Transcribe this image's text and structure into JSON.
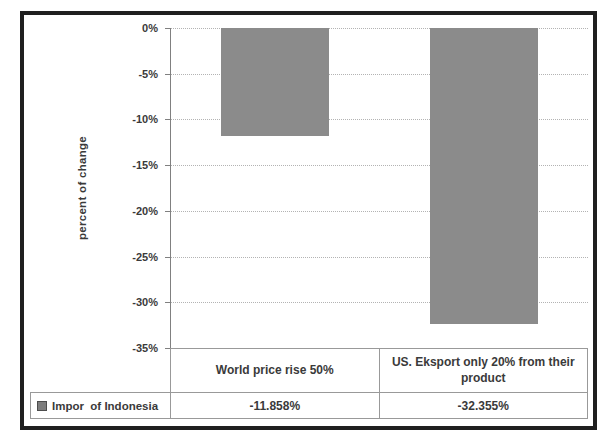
{
  "chart_data": {
    "type": "bar",
    "title": "",
    "xlabel": "",
    "ylabel": "percent of change",
    "categories": [
      "World price rise 50%",
      "US. Eksport only 20% from their product"
    ],
    "series": [
      {
        "name": "Impor  of Indonesia",
        "values": [
          -11.858,
          -32.355
        ]
      }
    ],
    "value_labels": [
      "-11.858%",
      "-32.355%"
    ],
    "y_ticks": [
      "0%",
      "-5%",
      "-10%",
      "-15%",
      "-20%",
      "-25%",
      "-30%",
      "-35%"
    ],
    "ylim": [
      -35,
      0
    ],
    "y_tick_step": 5,
    "grid": true,
    "legend_position": "bottom-left-data-table",
    "colors": {
      "bar": "#8b8b8b",
      "text": "#3a3a3a",
      "gridline": "#b3b3b3",
      "axis_line": "#808080",
      "table_border": "#999999",
      "frame_border": "#1f1f1f",
      "background": "#ffffff"
    }
  }
}
